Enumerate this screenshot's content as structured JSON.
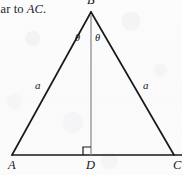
{
  "figure": {
    "caption_fragment": {
      "lead_text": "lar to ",
      "italic_text": "AC",
      "trailing_text": "."
    },
    "vertices": [
      {
        "name": "apex",
        "label": "B",
        "x": 91,
        "y": 12
      },
      {
        "name": "bottom-left",
        "label": "A",
        "x": 12,
        "y": 155
      },
      {
        "name": "foot",
        "label": "D",
        "x": 91,
        "y": 155
      },
      {
        "name": "bottom-right",
        "label": "C",
        "x": 174,
        "y": 155
      }
    ],
    "side_labels": [
      {
        "name": "left-leg",
        "label": "a",
        "x": 37,
        "y": 85
      },
      {
        "name": "right-leg",
        "label": "a",
        "x": 145,
        "y": 85
      }
    ],
    "angle_labels": [
      {
        "name": "left-apex-angle",
        "label": "θ",
        "x": 77,
        "y": 38
      },
      {
        "name": "right-apex-angle",
        "label": "θ",
        "x": 97,
        "y": 38
      }
    ],
    "right_angle_marker": {
      "label": "right-angle at D",
      "size": 8
    },
    "colors": {
      "background": "#fbfbfc",
      "stroke": "#1a1a1e",
      "altitude_stroke": "#8a8a90",
      "text": "#16161a"
    }
  }
}
